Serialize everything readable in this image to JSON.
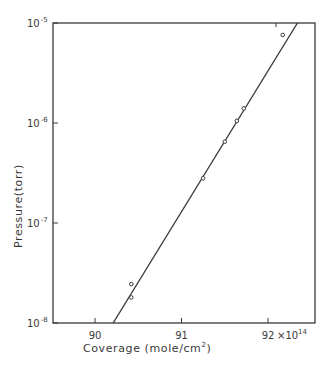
{
  "chart_data": {
    "type": "scatter",
    "title": "",
    "xlabel": "Coverage (mole/cm²)",
    "xlabel_parts": {
      "main": "Coverage (mole/cm",
      "sup": "2",
      "end": ")"
    },
    "ylabel": "Pressure(torr)",
    "x_multiplier": "×10^14",
    "x_multiplier_parts": {
      "base": "×10",
      "exp": "14"
    },
    "xlim": [
      89.55,
      92.6
    ],
    "ylim": [
      1e-08,
      1e-05
    ],
    "yscale": "log",
    "grid": false,
    "legend": null,
    "x_ticks": [
      {
        "value": 90,
        "label": "90"
      },
      {
        "value": 91,
        "label": "91"
      },
      {
        "value": 92,
        "label": "92"
      }
    ],
    "y_ticks": [
      {
        "value": 1e-05,
        "base": "10",
        "exp": "-5"
      },
      {
        "value": 1e-06,
        "base": "10",
        "exp": "-6"
      },
      {
        "value": 1e-07,
        "base": "10",
        "exp": "-7"
      },
      {
        "value": 1e-08,
        "base": "10",
        "exp": "-8"
      }
    ],
    "series": [
      {
        "name": "measured",
        "marker": "open-circle",
        "x": [
          90.42,
          90.42,
          91.25,
          91.5,
          91.64,
          91.72,
          92.17
        ],
        "y": [
          2.45e-08,
          1.8e-08,
          2.8e-07,
          6.5e-07,
          1.05e-06,
          1.4e-06,
          7.6e-06
        ]
      },
      {
        "name": "fit",
        "type": "line",
        "x": [
          90.21,
          92.34
        ],
        "y": [
          1e-08,
          1e-05
        ]
      }
    ]
  },
  "colors": {
    "ink": "#3a3a3a",
    "background": "#ffffff"
  }
}
